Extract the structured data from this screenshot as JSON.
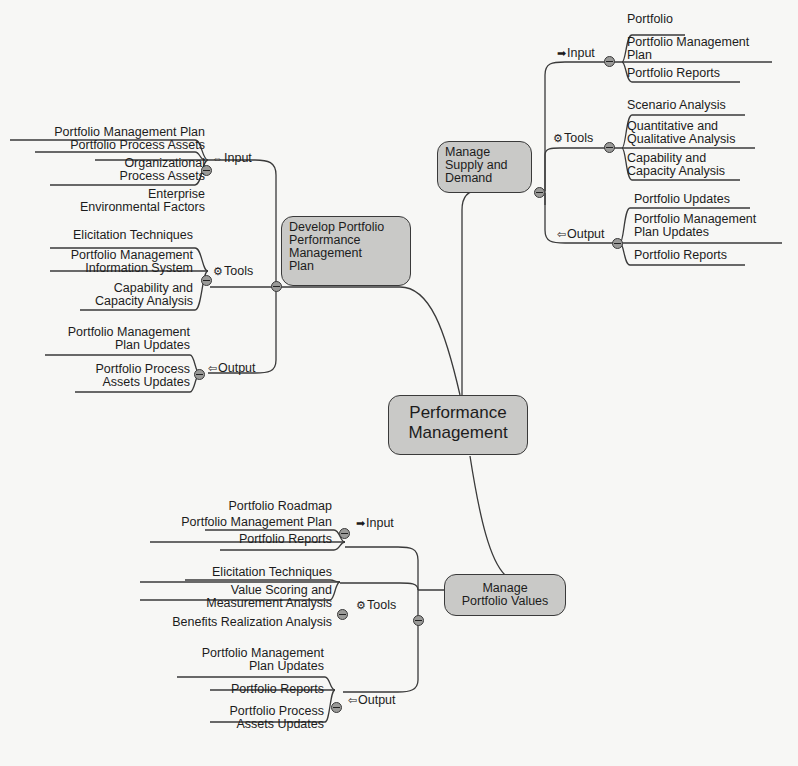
{
  "center": {
    "label_line1": "Performance",
    "label_line2": "Management"
  },
  "develop": {
    "title_lines": [
      "Develop Portfolio",
      "Performance",
      "Management",
      "Plan"
    ],
    "input": {
      "label": "Input",
      "icon": "double-arrow-icon",
      "items": [
        "Portfolio Management Plan",
        "Portfolio Process Assets",
        "Organizational",
        "Process Assets",
        "Enterprise",
        "Environmental Factors"
      ]
    },
    "tools": {
      "label": "Tools",
      "icon": "gear-icon",
      "items": [
        "Elicitation Techniques",
        "Portfolio Management",
        "Information System",
        "Capability and",
        "Capacity Analysis"
      ]
    },
    "output": {
      "label": "Output",
      "icon": "left-arrow-icon",
      "items": [
        "Portfolio Management",
        "Plan Updates",
        "Portfolio Process",
        "Assets Updates"
      ]
    }
  },
  "supply": {
    "title_lines": [
      "Manage",
      "Supply and",
      "Demand"
    ],
    "input": {
      "label": "Input",
      "icon": "right-arrow-icon",
      "items": [
        "Portfolio",
        "Portfolio Management",
        "Plan",
        "Portfolio Reports"
      ]
    },
    "tools": {
      "label": "Tools",
      "icon": "gear-icon",
      "items": [
        "Scenario Analysis",
        "Quantitative and",
        "Qualitative Analysis",
        "Capability and",
        "Capacity Analysis"
      ]
    },
    "output": {
      "label": "Output",
      "icon": "left-arrow-icon",
      "items": [
        "Portfolio Updates",
        "Portfolio Management",
        "Plan Updates",
        "Portfolio Reports"
      ]
    }
  },
  "values": {
    "title_lines": [
      "Manage",
      "Portfolio Values"
    ],
    "input": {
      "label": "Input",
      "icon": "right-arrow-icon",
      "items": [
        "Portfolio Roadmap",
        "Portfolio Management Plan",
        "Portfolio Reports"
      ]
    },
    "tools": {
      "label": "Tools",
      "icon": "gear-icon",
      "items": [
        "Elicitation Techniques",
        "Value Scoring and",
        "Measurement Analysis",
        "Benefits Realization Analysis"
      ]
    },
    "output": {
      "label": "Output",
      "icon": "left-arrow-icon",
      "items": [
        "Portfolio Management",
        "Plan Updates",
        "Portfolio Reports",
        "Portfolio Process",
        "Assets Updates"
      ]
    }
  },
  "icons": {
    "double_arrow": "⇔",
    "right_arrow": "➡",
    "left_arrow": "⇦",
    "gear": "⚙"
  }
}
